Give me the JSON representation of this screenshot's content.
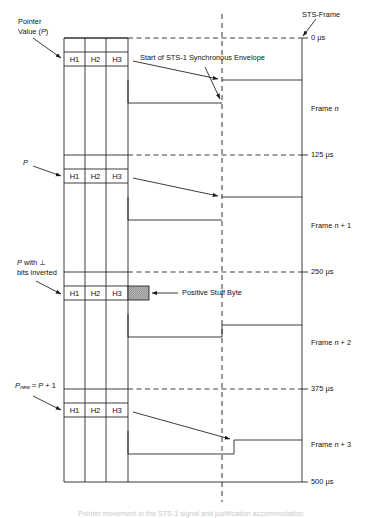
{
  "figure": {
    "type": "timing-diagram",
    "caption": "Pointer movement in the STS-1 signal and justification accommodation"
  },
  "annotations": {
    "pointer_value_line1": "Pointer",
    "pointer_value_line2": "Value (P)",
    "pointer_value_italic": "P",
    "p_label": "P",
    "p_inverted_line1": "P with ⊥",
    "p_inverted_line2": "bits inverted",
    "p_new": "P",
    "p_new_sub": "new",
    "p_new_rest": "= P + 1",
    "sts_frame": "STS-Frame",
    "envelope_start": "Start of STS-1 Synchronous Envelope",
    "positive_stuff_byte": "Positive Stuff Byte"
  },
  "overhead_bytes": [
    "H1",
    "H2",
    "H3"
  ],
  "time_axis": {
    "unit": "µs",
    "ticks": [
      {
        "label": "0 µs",
        "value": 0
      },
      {
        "label": "125 µs",
        "value": 125
      },
      {
        "label": "250 µs",
        "value": 250
      },
      {
        "label": "375 µs",
        "value": 375
      },
      {
        "label": "500 µs",
        "value": 500
      }
    ]
  },
  "frames": [
    {
      "prefix": "Frame ",
      "n": "n",
      "suffix": "",
      "label": "Frame n",
      "interval": "0 µs – 125 µs"
    },
    {
      "prefix": "Frame ",
      "n": "n",
      "suffix": " + 1",
      "label": "Frame n + 1",
      "interval": "125 µs – 250 µs"
    },
    {
      "prefix": "Frame ",
      "n": "n",
      "suffix": " + 2",
      "label": "Frame n + 2",
      "interval": "250 µs – 375 µs"
    },
    {
      "prefix": "Frame ",
      "n": "n",
      "suffix": " + 3",
      "label": "Frame n + 3",
      "interval": "375 µs – 500 µs"
    }
  ],
  "colors": {
    "line": "#1a1a1a",
    "stuff_byte_fill": "#a8a8a8",
    "background": "#ffffff"
  }
}
